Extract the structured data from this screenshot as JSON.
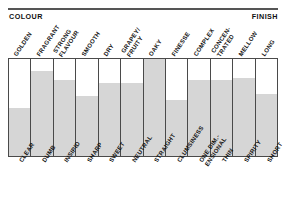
{
  "header": {
    "left_caption": "COLOUR",
    "right_caption": "FINISH"
  },
  "chart_data": {
    "type": "bar",
    "title": "",
    "xlabel": "",
    "ylabel": "",
    "ylim": [
      0,
      100
    ],
    "grid": false,
    "legend": "none",
    "orientation": "vertical",
    "axis_top_labels": [
      "GOLDEN",
      "FRAGRANT",
      "STRONG\nFLAVOUR",
      "SMOOTH",
      "DRY",
      "GRAPEY/\nFRUITY",
      "OAKY",
      "FINESSE",
      "COMPLEX",
      "CONCEN-\nTRATED",
      "MELLOW",
      "LONG"
    ],
    "categories": [
      "CLEAR",
      "DUMB",
      "INSIPID",
      "SHARP",
      "SWEET",
      "NEUTRAL",
      "STRAIGHT",
      "CLUMSINESS",
      "ONE DIM.-\nENSIONAL",
      "THIN",
      "SPIRITY",
      "SHORT"
    ],
    "values": [
      50,
      88,
      78,
      62,
      75,
      75,
      100,
      58,
      78,
      78,
      80,
      64
    ],
    "bar_color": "#d6d6d6",
    "frame_color": "#4a4a4a"
  },
  "top_labels": [
    {
      "lines": [
        "GOLDEN"
      ]
    },
    {
      "lines": [
        "FRAGRANT"
      ]
    },
    {
      "lines": [
        "STRONG",
        "FLAVOUR"
      ]
    },
    {
      "lines": [
        "SMOOTH"
      ]
    },
    {
      "lines": [
        "DRY"
      ]
    },
    {
      "lines": [
        "GRAPEY/",
        "FRUITY"
      ]
    },
    {
      "lines": [
        "OAKY"
      ]
    },
    {
      "lines": [
        "FINESSE"
      ]
    },
    {
      "lines": [
        "COMPLEX"
      ]
    },
    {
      "lines": [
        "CONCEN-",
        "TRATED"
      ]
    },
    {
      "lines": [
        "MELLOW"
      ]
    },
    {
      "lines": [
        "LONG"
      ]
    }
  ],
  "bottom_labels": [
    {
      "lines": [
        "CLEAR"
      ]
    },
    {
      "lines": [
        "DUMB"
      ]
    },
    {
      "lines": [
        "INSIPID"
      ]
    },
    {
      "lines": [
        "SHARP"
      ]
    },
    {
      "lines": [
        "SWEET"
      ]
    },
    {
      "lines": [
        "NEUTRAL"
      ]
    },
    {
      "lines": [
        "STRAIGHT"
      ]
    },
    {
      "lines": [
        "CLUMSINESS"
      ]
    },
    {
      "lines": [
        "ONE DIM.-",
        "ENSIONAL"
      ]
    },
    {
      "lines": [
        "THIN"
      ]
    },
    {
      "lines": [
        "SPIRITY"
      ]
    },
    {
      "lines": [
        "SHORT"
      ]
    }
  ]
}
